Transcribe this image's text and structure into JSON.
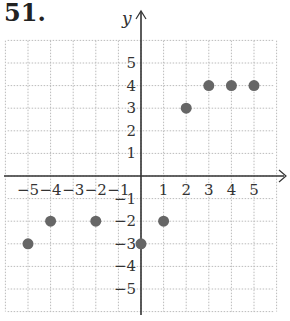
{
  "problem": {
    "number": "51."
  },
  "chart_data": {
    "type": "scatter",
    "title": "",
    "xlabel": "x",
    "ylabel": "y",
    "xlim": [
      -6,
      6
    ],
    "ylim": [
      -6,
      6
    ],
    "grid": true,
    "x_ticks": [
      -5,
      -4,
      -3,
      -2,
      -1,
      1,
      2,
      3,
      4,
      5
    ],
    "y_ticks": [
      -5,
      -4,
      -3,
      -2,
      -1,
      1,
      2,
      3,
      4,
      5
    ],
    "points": [
      {
        "x": -5,
        "y": -3
      },
      {
        "x": -4,
        "y": -2
      },
      {
        "x": -2,
        "y": -2
      },
      {
        "x": 0,
        "y": -3
      },
      {
        "x": 1,
        "y": -2
      },
      {
        "x": 2,
        "y": 3
      },
      {
        "x": 3,
        "y": 4
      },
      {
        "x": 4,
        "y": 4
      },
      {
        "x": 5,
        "y": 4
      }
    ],
    "point_color": "#666666"
  }
}
